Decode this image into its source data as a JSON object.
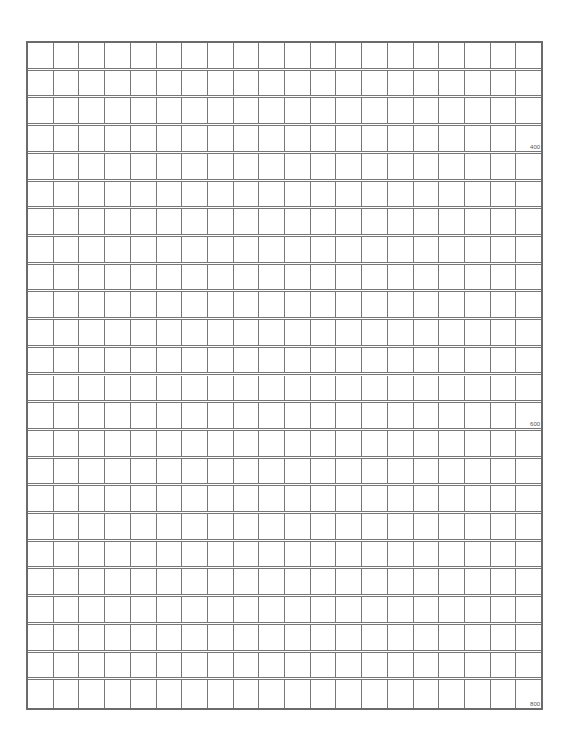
{
  "sheet": {
    "type": "manuscript-grid-paper",
    "columns": 20,
    "rows": 24,
    "line_color": "#777777",
    "count_labels": [
      {
        "row": 4,
        "text": "400"
      },
      {
        "row": 14,
        "text": "600"
      },
      {
        "row": 24,
        "text": "800"
      }
    ]
  }
}
